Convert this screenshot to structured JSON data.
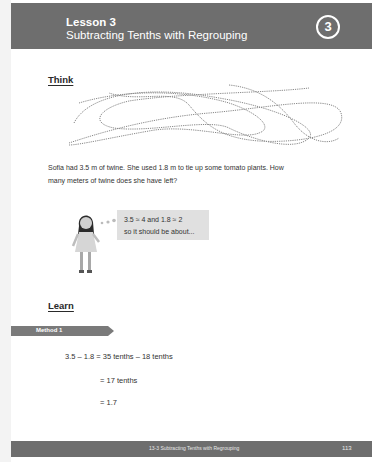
{
  "header": {
    "lesson_number": "Lesson 3",
    "lesson_title": "Subtracting Tenths with Regrouping",
    "badge": "3"
  },
  "think": {
    "heading": "Think",
    "illustration": "twine-icon",
    "problem_line1": "Sofia had 3.5 m of twine. She used 1.8 m to tie up some tomato plants. How",
    "problem_line2": "many meters of twine does she have left?",
    "character": "girl-figure-icon",
    "bubble_line1": "3.5 ≈ 4 and 1.8 ≈ 2",
    "bubble_line2": "so it should be about..."
  },
  "learn": {
    "heading": "Learn",
    "method_label": "Method 1",
    "equations": [
      "3.5 – 1.8 = 35 tenths – 18 tenths",
      "= 17 tenths",
      "= 1.7"
    ]
  },
  "footer": {
    "title": "13-3 Subtracting Tenths with Regrouping",
    "page_number": "113"
  },
  "colors": {
    "header_bg": "#6e6e6e",
    "bubble_bg": "#e0e0e0",
    "page_bg": "#ffffff"
  }
}
